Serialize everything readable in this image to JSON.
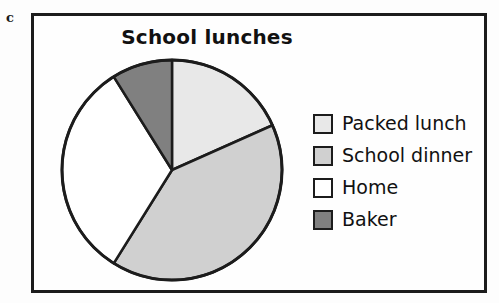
{
  "panel": {
    "letter": "c"
  },
  "chart_data": {
    "type": "pie",
    "title": "School lunches",
    "xlabel": "",
    "ylabel": "",
    "legend_position": "right",
    "grid": false,
    "categories": [
      "Packed lunch",
      "School dinner",
      "Home",
      "Baker"
    ],
    "values": [
      18,
      41,
      32,
      9
    ],
    "value_unit": "percent",
    "slice_angles_deg": [
      66,
      146,
      116,
      32
    ],
    "start_angle_deg": 0,
    "direction": "clockwise",
    "colors": [
      "#e8e8e8",
      "#d0d0d0",
      "#ffffff",
      "#808080"
    ],
    "slice_outline_color": "#1c1c1c",
    "slices": [
      {
        "label": "Packed lunch",
        "value": 18,
        "angle_deg": 66,
        "color": "#e8e8e8"
      },
      {
        "label": "School dinner",
        "value": 41,
        "angle_deg": 146,
        "color": "#d0d0d0"
      },
      {
        "label": "Home",
        "value": 32,
        "angle_deg": 116,
        "color": "#ffffff"
      },
      {
        "label": "Baker",
        "value": 9,
        "angle_deg": 32,
        "color": "#808080"
      }
    ]
  },
  "legend": {
    "items": [
      {
        "label": "Packed lunch",
        "color": "#e8e8e8"
      },
      {
        "label": "School dinner",
        "color": "#d0d0d0"
      },
      {
        "label": "Home",
        "color": "#ffffff"
      },
      {
        "label": "Baker",
        "color": "#808080"
      }
    ]
  }
}
